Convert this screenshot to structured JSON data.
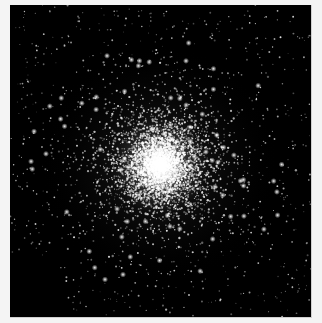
{
  "image": {
    "subject": "globular star cluster",
    "frame": {
      "x": 10,
      "y": 5,
      "width": 301,
      "height": 312
    },
    "background_color": "#000000",
    "page_color": "#f4f4f4",
    "cluster": {
      "center": [
        150,
        160
      ],
      "core_radius": 22,
      "halo_radius": 120,
      "core_color": "#ffffff",
      "star_count_dense": 5200,
      "star_count_field": 900,
      "bright_stars": 70,
      "seed": 1337
    }
  }
}
